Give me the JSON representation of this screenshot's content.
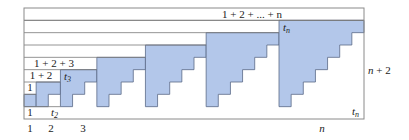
{
  "diagram": {
    "n": 7,
    "rows": 9,
    "frame": {
      "x": 24,
      "y": 8,
      "width": 340,
      "height": 111
    },
    "colors": {
      "fill": "#b3c7ea",
      "stroke": "#5a6a86",
      "frame": "#8a8a8a",
      "row_line": "#7a7a7a",
      "text": "#222222"
    },
    "labels": {
      "top_sum": "1 + 2 + ... + n",
      "sum_3": "1 + 2 + 3",
      "sum_2": "1 + 2",
      "sum_1": "1",
      "bottom_left_1": "1",
      "t2": "t",
      "t2_sub": "2",
      "t3": "t",
      "t3_sub": "3",
      "tn_top": "t",
      "tn_top_sub": "n",
      "tn_bottom": "t",
      "tn_bottom_sub": "n",
      "height": "n + 2",
      "axis_1": "1",
      "axis_2": "2",
      "axis_3": "3",
      "axis_n": "n"
    }
  }
}
